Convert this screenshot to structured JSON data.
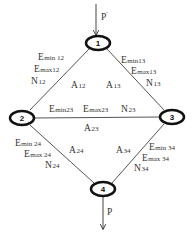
{
  "diagram": {
    "title": "",
    "colors": {
      "line": "#555555",
      "node_border": "#111111",
      "text": "#333333",
      "background": "#ffffff"
    },
    "nodes": [
      {
        "id": "1",
        "label": "1",
        "cx": 98,
        "cy": 43
      },
      {
        "id": "2",
        "label": "2",
        "cx": 22,
        "cy": 118
      },
      {
        "id": "3",
        "label": "3",
        "cx": 172,
        "cy": 117
      },
      {
        "id": "4",
        "label": "4",
        "cx": 103,
        "cy": 189
      }
    ],
    "loads": {
      "top": {
        "label": "P'",
        "base": "P",
        "prime": "'"
      },
      "bottom": {
        "label": "P",
        "base": "P"
      }
    },
    "edges": {
      "e12": {
        "from": "1",
        "to": "2",
        "area": "A12",
        "a_base": "A",
        "a_sub": "12",
        "props": [
          {
            "base": "E",
            "sub": "min 12"
          },
          {
            "base": "E",
            "sub": "max12"
          },
          {
            "base": "N",
            "sub": "12"
          }
        ]
      },
      "e13": {
        "from": "1",
        "to": "3",
        "area": "A13",
        "a_base": "A",
        "a_sub": "13",
        "props": [
          {
            "base": "E",
            "sub": "min13"
          },
          {
            "base": "E",
            "sub": "max13"
          },
          {
            "base": "N",
            "sub": "13"
          }
        ]
      },
      "e23": {
        "from": "2",
        "to": "3",
        "area": "A23",
        "a_base": "A",
        "a_sub": "23",
        "props": [
          {
            "base": "E",
            "sub": "min23"
          },
          {
            "base": "E",
            "sub": "max23"
          },
          {
            "base": "N",
            "sub": "23"
          }
        ]
      },
      "e24": {
        "from": "2",
        "to": "4",
        "area": "A24",
        "a_base": "A",
        "a_sub": "24",
        "props": [
          {
            "base": "E",
            "sub": "min 24"
          },
          {
            "base": "E",
            "sub": "max 24"
          },
          {
            "base": "N",
            "sub": "24"
          }
        ]
      },
      "e34": {
        "from": "3",
        "to": "4",
        "area": "A34",
        "a_base": "A",
        "a_sub": "34",
        "props": [
          {
            "base": "E",
            "sub": "min 34"
          },
          {
            "base": "E",
            "sub": "max 34"
          },
          {
            "base": "N",
            "sub": "34"
          }
        ]
      }
    }
  }
}
